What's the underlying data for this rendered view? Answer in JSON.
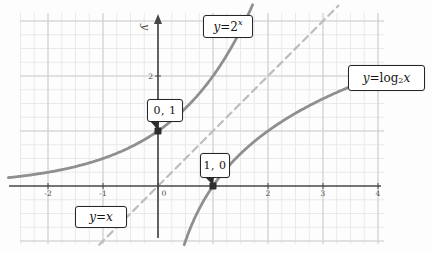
{
  "figure": {
    "width": 433,
    "height": 254,
    "colors": {
      "background": "#fdfdfd",
      "grid_minor": "#e9e9e9",
      "grid_major": "#cfcfcf",
      "axis": "#474747",
      "curve": "#8f8f8f",
      "identity_dash": "#bdbdbd",
      "point": "#2d2d2d",
      "box_border": "#262626",
      "tick_text": "#4a4a4a",
      "label_text": "#141414"
    }
  },
  "chart_data": {
    "type": "line",
    "title": "",
    "xlabel": "",
    "ylabel": "y",
    "xlim": [
      -2.7,
      4.15
    ],
    "ylim": [
      -1.25,
      3.2
    ],
    "grid": {
      "visible": true,
      "minor_step": 0.25,
      "major_step": 1
    },
    "x_axis": {
      "ticks": [
        -2,
        -1,
        0,
        2,
        3,
        4
      ],
      "tick_labels": [
        "-2",
        "-1",
        "0",
        "2",
        "3",
        "4"
      ]
    },
    "y_axis": {
      "label": "y",
      "ticks": [
        2
      ],
      "tick_labels": [
        "2"
      ]
    },
    "series": [
      {
        "id": "exponential",
        "name": "y = 2^x",
        "fn": "pow2",
        "style": "solid",
        "domain": [
          -2.72,
          1.735
        ],
        "key_points": [
          [
            -2,
            0.25
          ],
          [
            -1,
            0.5
          ],
          [
            0,
            1
          ],
          [
            1,
            2
          ]
        ]
      },
      {
        "id": "logarithm",
        "name": "y = log2(x)",
        "fn": "log2",
        "style": "solid",
        "range": [
          -1.07,
          2.06
        ],
        "key_points": [
          [
            0.5,
            -1
          ],
          [
            1,
            0
          ],
          [
            2,
            1
          ],
          [
            4,
            2
          ]
        ]
      },
      {
        "id": "identity",
        "name": "y = x",
        "fn": "identity",
        "style": "dashed",
        "domain": [
          -1.07,
          3.28
        ],
        "key_points": [
          [
            -1,
            -1
          ],
          [
            0,
            0
          ],
          [
            1,
            1
          ],
          [
            2,
            2
          ],
          [
            3,
            3
          ]
        ]
      }
    ],
    "points": [
      {
        "id": "point-0-1",
        "label": "0, 1",
        "x": 0,
        "y": 1
      },
      {
        "id": "point-1-0",
        "label": "1, 0",
        "x": 1,
        "y": 0
      }
    ],
    "layout": {
      "origin_px": [
        158,
        186
      ],
      "unit_px": 55,
      "grid_box_px": [
        20,
        13,
        364,
        231
      ],
      "x_axis_px": [
        9,
        381
      ],
      "y_axis_px": [
        21,
        238
      ],
      "axis_label_pos_px": [
        142,
        27
      ]
    }
  },
  "annotations": [
    {
      "id": "exponential",
      "kind": "equation",
      "box_px": [
        203,
        15,
        50,
        23
      ],
      "parts": [
        {
          "t": "y",
          "i": true
        },
        {
          "t": " = "
        },
        {
          "t": "2"
        },
        {
          "t": "x",
          "sup": true
        }
      ]
    },
    {
      "id": "logarithm",
      "kind": "equation",
      "box_px": [
        348,
        65,
        77,
        26
      ],
      "parts": [
        {
          "t": "y",
          "i": true
        },
        {
          "t": " = "
        },
        {
          "t": "log"
        },
        {
          "t": "2",
          "sub": true
        },
        {
          "t": " x",
          "i": true
        }
      ]
    },
    {
      "id": "identity",
      "kind": "equation",
      "box_px": [
        75,
        206,
        52,
        22
      ],
      "parts": [
        {
          "t": "y",
          "i": true
        },
        {
          "t": " = "
        },
        {
          "t": "x",
          "i": true
        }
      ]
    },
    {
      "id": "point-0-1",
      "kind": "point-label",
      "box_px": [
        147,
        99,
        36,
        23
      ],
      "parts": [
        {
          "t": "0, 1"
        }
      ],
      "wedge_to": {
        "x": 0,
        "y": 1
      }
    },
    {
      "id": "point-1-0",
      "kind": "point-label",
      "box_px": [
        200,
        153,
        30,
        25
      ],
      "parts": [
        {
          "t": "1, 0"
        }
      ],
      "wedge_to": {
        "x": 1,
        "y": 0
      }
    }
  ]
}
